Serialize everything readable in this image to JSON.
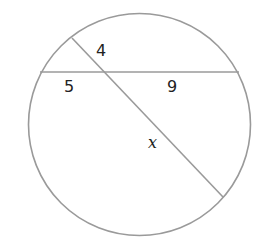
{
  "diagram": {
    "type": "intersecting-chords-in-circle",
    "stroke_color": "#9a9a9a",
    "circle": {
      "cx": 139.5,
      "cy": 124.5,
      "r": 111
    },
    "chords": [
      {
        "name": "horizontal-chord",
        "x1": 40,
        "y1": 72,
        "x2": 239,
        "y2": 72
      },
      {
        "name": "diagonal-chord",
        "x1": 72,
        "y1": 38,
        "x2": 223,
        "y2": 197
      }
    ],
    "labels": {
      "upper_diagonal_segment": "4",
      "left_horizontal_segment": "5",
      "right_horizontal_segment": "9",
      "lower_diagonal_segment": "x"
    }
  }
}
